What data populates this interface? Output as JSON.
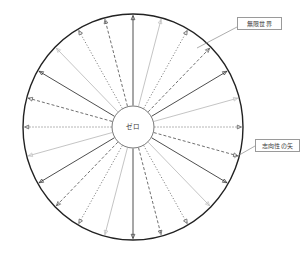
{
  "diagram": {
    "type": "radial-spoke-diagram",
    "title_visible": false,
    "background_color": "#ffffff",
    "outer_circle": {
      "center_x": 133,
      "center_y": 127,
      "radius_x": 110,
      "radius_y": 113,
      "stroke_color": "#222222",
      "stroke_width": 1.4,
      "fill": "none"
    },
    "hub_circle": {
      "center_x": 133,
      "center_y": 127,
      "radius": 21,
      "stroke_color": "#555555",
      "stroke_width": 0.8,
      "fill": "#ffffff",
      "label": "ゼロ"
    },
    "spokes": {
      "count": 24,
      "start_angle_deg": -90,
      "arrowheads": true,
      "arrowhead_position": "outer-rim",
      "styles": [
        {
          "name": "solid-dark",
          "color": "#3a3a3a",
          "width": 0.9,
          "dash": "none"
        },
        {
          "name": "solid-light",
          "color": "#bdbdbd",
          "width": 0.9,
          "dash": "none"
        },
        {
          "name": "dotted",
          "color": "#4a4a4a",
          "width": 0.8,
          "dash": "1,2"
        },
        {
          "name": "dashed",
          "color": "#4a4a4a",
          "width": 0.8,
          "dash": "3,2"
        }
      ],
      "sequence": [
        "solid-dark",
        "solid-light",
        "dotted",
        "dashed",
        "solid-dark",
        "solid-light",
        "dotted",
        "dashed",
        "solid-dark",
        "solid-light",
        "dotted",
        "dashed",
        "solid-dark",
        "solid-light",
        "dotted",
        "dashed",
        "solid-dark",
        "solid-light",
        "dotted",
        "dashed",
        "solid-dark",
        "solid-light",
        "dotted",
        "dashed"
      ]
    },
    "callouts": [
      {
        "id": "infinite-world",
        "label": "無限世界",
        "box_x": 237,
        "box_y": 17,
        "box_width": 45,
        "box_height": 13,
        "leader_from_x": 237,
        "leader_from_y": 27,
        "leader_to_x": 197,
        "leader_to_y": 48,
        "leader_color": "#8a8a8a",
        "border_color": "#9a9a9a"
      },
      {
        "id": "intentionality-arrow",
        "label": "志向性の矢",
        "box_x": 255,
        "box_y": 139,
        "box_width": 45,
        "box_height": 13,
        "leader_from_x": 255,
        "leader_from_y": 146,
        "leader_to_x": 234,
        "leader_to_y": 158,
        "leader_color": "#8a8a8a",
        "border_color": "#9a9a9a"
      }
    ]
  }
}
